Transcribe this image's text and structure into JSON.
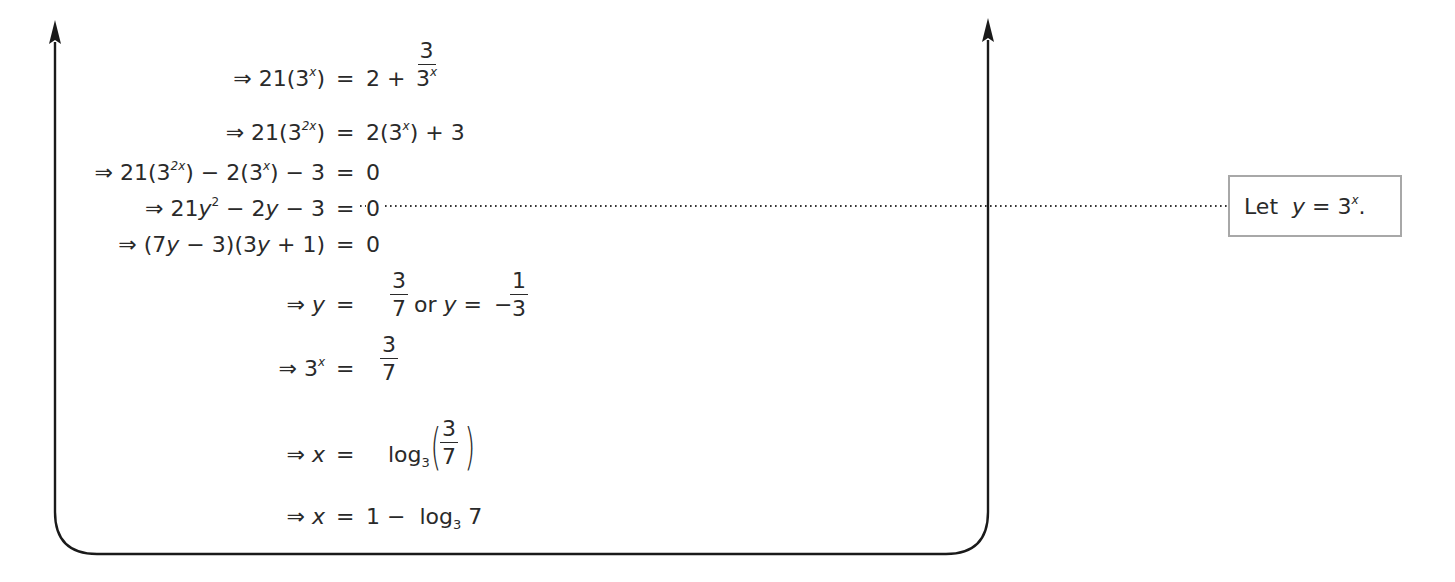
{
  "document": {
    "steps": [
      {
        "lhs_arrow": "⇒",
        "lhs": "21(3",
        "lhs_sup": "x",
        "lhs_end": ")",
        "eq": "=",
        "rhs_pre": "2 +",
        "rhs_frac_num": "3",
        "rhs_frac_den": "3",
        "rhs_frac_den_sup": "x"
      },
      {
        "lhs_arrow": "⇒",
        "lhs": "21(3",
        "lhs_sup": "2x",
        "lhs_end": ")",
        "eq": "=",
        "rhs": "2(3",
        "rhs_sup": "x",
        "rhs_end": ") + 3"
      },
      {
        "lhs_arrow": "⇒",
        "lhs": "21(3",
        "lhs_sup": "2x",
        "lhs_mid": ") − 2(3",
        "lhs_sup2": "x",
        "lhs_end": ") − 3",
        "eq": "=",
        "rhs": "0"
      },
      {
        "lhs_arrow": "⇒",
        "lhs": "21",
        "lhs_var": "y",
        "lhs_sup": "2",
        "lhs_mid": " − 2",
        "lhs_var2": "y",
        "lhs_end": " − 3",
        "eq": "=",
        "rhs": "0"
      },
      {
        "lhs_arrow": "⇒",
        "lhs": "(7",
        "lhs_var": "y",
        "lhs_mid": " − 3)(3",
        "lhs_var2": "y",
        "lhs_end": " + 1)",
        "eq": "=",
        "rhs": "0"
      },
      {
        "lhs_arrow": "⇒",
        "lhs_var": "y",
        "eq": "=",
        "rhs_frac_num": "3",
        "rhs_frac_den": "7",
        "rhs_or": "or",
        "rhs_var": "y",
        "rhs_eq2": "=",
        "rhs_neg": "−",
        "rhs_frac2_num": "1",
        "rhs_frac2_den": "3"
      },
      {
        "lhs_arrow": "⇒",
        "lhs": "3",
        "lhs_sup": "x",
        "eq": "=",
        "rhs_frac_num": "3",
        "rhs_frac_den": "7"
      },
      {
        "lhs_arrow": "⇒",
        "lhs_var": "x",
        "eq": "=",
        "rhs_log": "log",
        "rhs_log_base": "3",
        "rhs_frac_num": "3",
        "rhs_frac_den": "7"
      },
      {
        "lhs_arrow": "⇒",
        "lhs_var": "x",
        "eq": "=",
        "rhs_pre": "1 −",
        "rhs_log": "log",
        "rhs_log_base": "3",
        "rhs_post": "7"
      }
    ],
    "annotation": {
      "prefix": "Let",
      "var": "y",
      "eq": "=",
      "base": "3",
      "sup": "x",
      "suffix": "."
    }
  },
  "colors": {
    "ink": "#2a2a2a",
    "box_border": "#a8a8a8",
    "frame": "#1a1a1a"
  }
}
